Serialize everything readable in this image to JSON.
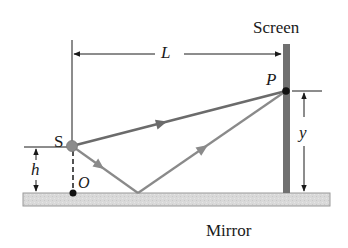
{
  "diagram": {
    "labels": {
      "screen": "Screen",
      "mirror": "Mirror",
      "source": "S",
      "point_p": "P",
      "origin": "O",
      "distance_L": "L",
      "height_h": "h",
      "height_y": "y"
    },
    "colors": {
      "direct_ray": "#6b6b6b",
      "reflected_ray": "#8a8a8a",
      "screen": "#707070",
      "mirror_fill": "#d9d9d9",
      "mirror_edge": "#9a9a9a",
      "source_dot": "#8c8c8c",
      "point_dot": "#111111",
      "dimension_lines": "#1a1a1a"
    },
    "geometry": {
      "source": [
        72,
        146
      ],
      "point_p": [
        286,
        91
      ],
      "origin": [
        73,
        193
      ],
      "reflection_point": [
        138,
        193
      ],
      "screen_x": 286,
      "mirror_y": 193
    }
  }
}
